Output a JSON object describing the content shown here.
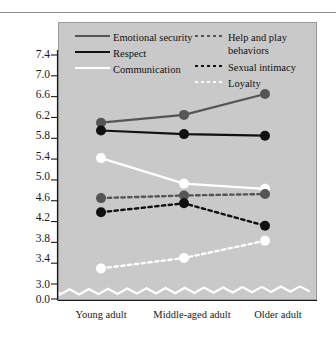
{
  "chart_data": {
    "type": "line",
    "title": "",
    "xlabel": "",
    "ylabel": "",
    "categories": [
      "Young adult",
      "Middle-aged adult",
      "Older adult"
    ],
    "ytick_labels": [
      "7.4",
      "7.0",
      "6.6",
      "6.2",
      "5.8",
      "5.4",
      "5.0",
      "4.6",
      "4.2",
      "3.8",
      "3.4",
      "3.0",
      "0.0"
    ],
    "ytick_values": [
      7.4,
      7.0,
      6.6,
      6.2,
      5.8,
      5.4,
      5.0,
      4.6,
      4.2,
      3.8,
      3.4,
      3.0,
      0.0
    ],
    "ylim": [
      3.0,
      7.6
    ],
    "y_axis_break": true,
    "grid": false,
    "legend_position": "inside-top",
    "plot_background": "#c9c9c9",
    "series": [
      {
        "name": "Emotional security",
        "values": [
          6.1,
          6.25,
          6.65
        ],
        "color": "#555555",
        "style": "solid",
        "marker": "circle"
      },
      {
        "name": "Respect",
        "values": [
          5.95,
          5.88,
          5.85
        ],
        "color": "#111111",
        "style": "solid",
        "marker": "circle"
      },
      {
        "name": "Communication",
        "values": [
          5.42,
          4.93,
          4.83
        ],
        "color": "#ffffff",
        "style": "solid",
        "marker": "circle"
      },
      {
        "name": "Help and play behaviors",
        "values": [
          4.65,
          4.7,
          4.73
        ],
        "color": "#555555",
        "style": "dashed",
        "marker": "circle"
      },
      {
        "name": "Sexual intimacy",
        "values": [
          4.38,
          4.55,
          4.12
        ],
        "color": "#111111",
        "style": "dashed",
        "marker": "circle"
      },
      {
        "name": "Loyalty",
        "values": [
          3.3,
          3.5,
          3.83
        ],
        "color": "#ffffff",
        "style": "dashed",
        "marker": "circle"
      }
    ]
  },
  "legend": {
    "entries": [
      {
        "label": "Emotional security"
      },
      {
        "label": "Respect"
      },
      {
        "label": "Communication"
      },
      {
        "label": "Help and play"
      },
      {
        "label": "behaviors"
      },
      {
        "label": "Sexual intimacy"
      },
      {
        "label": "Loyalty"
      }
    ]
  }
}
